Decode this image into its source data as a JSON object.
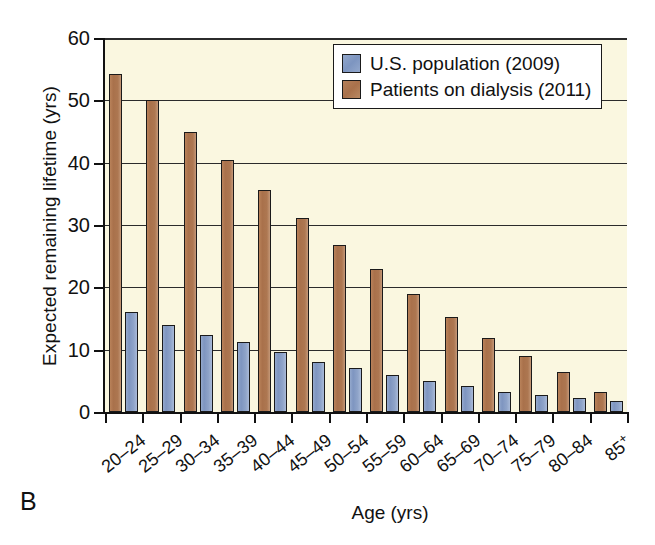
{
  "panel": {
    "letter": "B"
  },
  "chart_data": {
    "type": "bar",
    "title": "",
    "xlabel": "Age (yrs)",
    "ylabel": "Expected remaining lifetime (yrs)",
    "ylim": [
      0,
      60
    ],
    "yticks": [
      0,
      10,
      20,
      30,
      40,
      50,
      60
    ],
    "grid": true,
    "legend_position": "top-right",
    "categories": [
      "20–24",
      "25–29",
      "30–34",
      "35–39",
      "40–44",
      "45–49",
      "50–54",
      "55–59",
      "60–64",
      "65–69",
      "70–74",
      "75–79",
      "80–84",
      "85+"
    ],
    "series": [
      {
        "name": "U.S. population (2009)",
        "color": "#7d95c0",
        "values": [
          16.0,
          14.0,
          12.3,
          11.2,
          9.6,
          8.0,
          7.0,
          6.0,
          4.9,
          4.1,
          3.2,
          2.8,
          2.2,
          1.8
        ]
      },
      {
        "name": "Patients on dialysis (2011)",
        "color": "#a9714b",
        "values": [
          54.3,
          50.0,
          44.9,
          40.4,
          35.6,
          31.2,
          26.8,
          22.9,
          18.9,
          15.2,
          11.9,
          9.0,
          6.4,
          3.2
        ]
      }
    ]
  }
}
